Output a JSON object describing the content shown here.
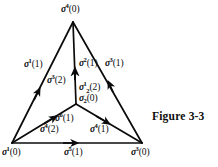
{
  "figure": {
    "caption": "Figure 3-3",
    "type": "oriented-simplicial-complex-diagram",
    "ink_color": "#0b0b0b",
    "background_color": "#ffffff"
  },
  "vertices": [
    {
      "id": "apex",
      "label_sym": "σ",
      "sup": "4",
      "value": "(0)",
      "x": 73,
      "y": 22
    },
    {
      "id": "bottom-left",
      "label_sym": "σ",
      "sup": "1",
      "value": "(0)",
      "x": 12,
      "y": 143
    },
    {
      "id": "bottom-right",
      "label_sym": "σ",
      "sup": "3",
      "value": "(0)",
      "x": 142,
      "y": 143
    },
    {
      "id": "interior",
      "label_sym": "σ",
      "sub": "2",
      "value": "(0)",
      "x": 76,
      "y": 104
    }
  ],
  "labels": {
    "apex": {
      "sym": "σ",
      "sup": "4",
      "value": "(0)"
    },
    "bottom_left": {
      "sym": "σ",
      "sup": "1",
      "value": "(0)"
    },
    "bottom_right": {
      "sym": "σ",
      "sup": "3",
      "value": "(0)"
    },
    "left_edge": {
      "sym": "σ",
      "sup": "1",
      "value": "(1)"
    },
    "center_edge": {
      "sym": "σ",
      "sup": "2",
      "value": "(1)"
    },
    "right_edge": {
      "sym": "σ",
      "sup": "3",
      "value": "(1)"
    },
    "bottom_edge": {
      "sym": "σ",
      "sup": "5",
      "value": "(1)"
    },
    "inner_left": {
      "sym": "σ",
      "sup": "6",
      "value": "(1)"
    },
    "inner_right": {
      "sym": "σ",
      "sup": "4",
      "value": "(1)"
    },
    "face_left": {
      "sym": "σ",
      "sup": "3",
      "value": "(2)"
    },
    "face_bottom": {
      "sym": "σ",
      "sup": "4",
      "value": "(2)"
    },
    "face_center": {
      "sym": "σ",
      "sup": "1",
      "sub": "2",
      "value": "(2)"
    },
    "solid_center": {
      "sym": "σ",
      "sub": "2",
      "value": "(0)"
    }
  },
  "edges": [
    {
      "name": "left-edge",
      "from": "bottom-left",
      "to": "apex",
      "arrow_at": 0.5,
      "label_key": "left_edge"
    },
    {
      "name": "right-edge",
      "from": "bottom-right",
      "to": "apex",
      "arrow_at": 0.5,
      "label_key": "right_edge"
    },
    {
      "name": "center-edge",
      "from": "interior",
      "to": "apex",
      "arrow_at": 0.5,
      "label_key": "center_edge"
    },
    {
      "name": "bottom-edge",
      "from": "bottom-left",
      "to": "bottom-right",
      "arrow_at": 0.5,
      "label_key": "bottom_edge"
    },
    {
      "name": "inner-left-edge",
      "from": "bottom-left",
      "to": "interior",
      "arrow_at": 0.62,
      "label_key": "inner_left"
    },
    {
      "name": "inner-right-edge",
      "from": "interior",
      "to": "bottom-right",
      "arrow_at": 0.4,
      "label_key": "inner_right"
    }
  ]
}
